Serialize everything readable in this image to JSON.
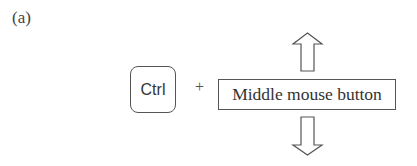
{
  "figure": {
    "panel_label": "(a)",
    "modifier_key": "Ctrl",
    "combiner": "+",
    "action_label": "Middle mouse button",
    "arrows": [
      {
        "direction": "up",
        "icon": "up-arrow-icon"
      },
      {
        "direction": "down",
        "icon": "down-arrow-icon"
      }
    ],
    "colors": {
      "stroke": "#555555",
      "text": "#333333",
      "background": "#ffffff"
    }
  }
}
